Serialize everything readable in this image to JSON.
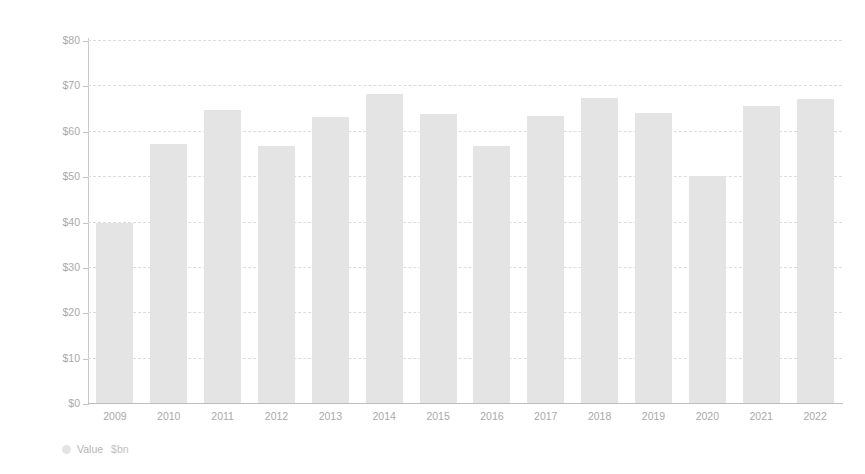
{
  "chart_data": {
    "type": "bar",
    "title": "",
    "xlabel": "",
    "ylabel": "$ billion",
    "categories": [
      "2009",
      "2010",
      "2011",
      "2012",
      "2013",
      "2014",
      "2015",
      "2016",
      "2017",
      "2018",
      "2019",
      "2020",
      "2021",
      "2022"
    ],
    "values": [
      39.6,
      57.0,
      64.5,
      56.6,
      63.0,
      68.0,
      63.8,
      56.6,
      63.3,
      67.3,
      64.0,
      50.1,
      65.5,
      67.1
    ],
    "series": [
      {
        "name": "Value $bn",
        "values": [
          39.6,
          57.0,
          64.5,
          56.6,
          63.0,
          68.0,
          63.8,
          56.6,
          63.3,
          67.3,
          64.0,
          50.1,
          65.5,
          67.1
        ]
      }
    ],
    "ylim": [
      0,
      80
    ],
    "ytick_values": [
      0,
      10,
      20,
      30,
      40,
      50,
      60,
      70,
      80
    ],
    "ytick_labels": [
      "$0",
      "$10",
      "$20",
      "$30",
      "$40",
      "$50",
      "$60",
      "$70",
      "$80"
    ],
    "grid": true,
    "grid_style": "dashed-horizontal",
    "legend_position": "bottom-left",
    "bar_color": "#e4e4e4",
    "grid_color": "#dcdcdc",
    "axis_color": "#c4c4c4",
    "text_color": "#a9a9a9"
  },
  "axis": {
    "y_caption": "$ billion"
  },
  "legend": {
    "marker_name": "value-series-marker",
    "label": "Value",
    "unit": "$bn"
  },
  "title_ghost": ""
}
